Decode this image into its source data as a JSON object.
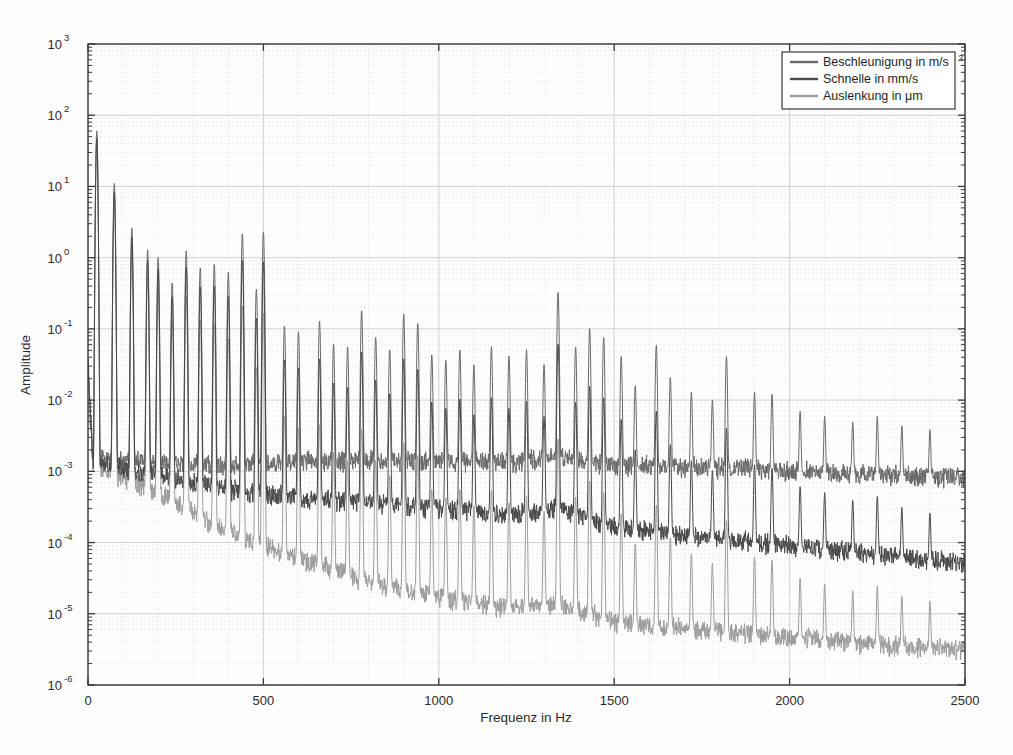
{
  "chart_data": {
    "type": "line",
    "title": "",
    "xlabel": "Frequenz in Hz",
    "ylabel": "Amplitude",
    "xlim": [
      0,
      2500
    ],
    "ylim": [
      1e-06,
      1000
    ],
    "yscale": "log",
    "xscale": "linear",
    "grid": true,
    "grid_minor": true,
    "legend_position": "top-right",
    "xticks": [
      0,
      500,
      1000,
      1500,
      2000,
      2500
    ],
    "xtick_labels": [
      "0",
      "500",
      "1000",
      "1500",
      "2000",
      "2500"
    ],
    "yticks": [
      1e-06,
      1e-05,
      0.0001,
      0.001,
      0.01,
      0.1,
      1,
      10,
      100,
      1000
    ],
    "ytick_labels": [
      "10-6",
      "10-5",
      "10-4",
      "10-3",
      "10-2",
      "10-1",
      "100",
      "101",
      "102",
      "103"
    ],
    "ytick_mantissa": [
      "10",
      "10",
      "10",
      "10",
      "10",
      "10",
      "10",
      "10",
      "10",
      "10"
    ],
    "ytick_exponents": [
      "-6",
      "-5",
      "-4",
      "-3",
      "-2",
      "-1",
      "0",
      "1",
      "2",
      "3"
    ],
    "series": [
      {
        "name": "Beschleunigung in m/s2",
        "label_base": "Beschleunigung in m/s",
        "label_exp": "2",
        "color": "#6b6b6b",
        "noise_floor": [
          {
            "f": 0,
            "a": 0.0016
          },
          {
            "f": 200,
            "a": 0.0013
          },
          {
            "f": 400,
            "a": 0.0012
          },
          {
            "f": 600,
            "a": 0.00135
          },
          {
            "f": 800,
            "a": 0.0014
          },
          {
            "f": 1000,
            "a": 0.0014
          },
          {
            "f": 1200,
            "a": 0.0013
          },
          {
            "f": 1340,
            "a": 0.0016
          },
          {
            "f": 1500,
            "a": 0.0012
          },
          {
            "f": 1800,
            "a": 0.0011
          },
          {
            "f": 2100,
            "a": 0.00095
          },
          {
            "f": 2500,
            "a": 0.0008
          }
        ],
        "peaks": [
          {
            "f": 25,
            "a": 60
          },
          {
            "f": 75,
            "a": 11
          },
          {
            "f": 125,
            "a": 2.6
          },
          {
            "f": 170,
            "a": 1.3
          },
          {
            "f": 200,
            "a": 1.0
          },
          {
            "f": 240,
            "a": 0.45
          },
          {
            "f": 280,
            "a": 1.25
          },
          {
            "f": 320,
            "a": 0.72
          },
          {
            "f": 360,
            "a": 0.82
          },
          {
            "f": 400,
            "a": 0.62
          },
          {
            "f": 440,
            "a": 2.2
          },
          {
            "f": 480,
            "a": 0.36
          },
          {
            "f": 500,
            "a": 2.3
          },
          {
            "f": 560,
            "a": 0.11
          },
          {
            "f": 600,
            "a": 0.09
          },
          {
            "f": 660,
            "a": 0.13
          },
          {
            "f": 700,
            "a": 0.06
          },
          {
            "f": 740,
            "a": 0.055
          },
          {
            "f": 780,
            "a": 0.18
          },
          {
            "f": 820,
            "a": 0.075
          },
          {
            "f": 860,
            "a": 0.05
          },
          {
            "f": 900,
            "a": 0.16
          },
          {
            "f": 940,
            "a": 0.12
          },
          {
            "f": 980,
            "a": 0.042
          },
          {
            "f": 1020,
            "a": 0.035
          },
          {
            "f": 1060,
            "a": 0.05
          },
          {
            "f": 1100,
            "a": 0.03
          },
          {
            "f": 1150,
            "a": 0.055
          },
          {
            "f": 1200,
            "a": 0.04
          },
          {
            "f": 1250,
            "a": 0.05
          },
          {
            "f": 1300,
            "a": 0.03
          },
          {
            "f": 1340,
            "a": 0.33
          },
          {
            "f": 1390,
            "a": 0.055
          },
          {
            "f": 1430,
            "a": 0.1
          },
          {
            "f": 1470,
            "a": 0.075
          },
          {
            "f": 1520,
            "a": 0.04
          },
          {
            "f": 1560,
            "a": 0.015
          },
          {
            "f": 1620,
            "a": 0.058
          },
          {
            "f": 1660,
            "a": 0.02
          },
          {
            "f": 1720,
            "a": 0.012
          },
          {
            "f": 1780,
            "a": 0.009
          },
          {
            "f": 1820,
            "a": 0.04
          },
          {
            "f": 1900,
            "a": 0.012
          },
          {
            "f": 1950,
            "a": 0.011
          },
          {
            "f": 2030,
            "a": 0.006
          },
          {
            "f": 2100,
            "a": 0.005
          },
          {
            "f": 2180,
            "a": 0.004
          },
          {
            "f": 2250,
            "a": 0.005
          },
          {
            "f": 2320,
            "a": 0.0035
          },
          {
            "f": 2400,
            "a": 0.003
          }
        ]
      },
      {
        "name": "Schnelle in mm/s",
        "label_base": "Schnelle in mm/s",
        "label_exp": "",
        "color": "#4a4a4a",
        "noise_floor": [
          {
            "f": 0,
            "a": 0.0013
          },
          {
            "f": 200,
            "a": 0.0009
          },
          {
            "f": 400,
            "a": 0.00055
          },
          {
            "f": 600,
            "a": 0.00042
          },
          {
            "f": 800,
            "a": 0.00036
          },
          {
            "f": 1000,
            "a": 0.0003
          },
          {
            "f": 1200,
            "a": 0.00024
          },
          {
            "f": 1340,
            "a": 0.0003
          },
          {
            "f": 1500,
            "a": 0.00016
          },
          {
            "f": 1800,
            "a": 0.00011
          },
          {
            "f": 2100,
            "a": 8e-05
          },
          {
            "f": 2500,
            "a": 5e-05
          }
        ],
        "peaks": [
          {
            "f": 25,
            "a": 60
          },
          {
            "f": 75,
            "a": 11
          },
          {
            "f": 125,
            "a": 2.6
          },
          {
            "f": 170,
            "a": 1.3
          },
          {
            "f": 200,
            "a": 1.0
          },
          {
            "f": 240,
            "a": 0.45
          },
          {
            "f": 280,
            "a": 1.25
          },
          {
            "f": 320,
            "a": 0.72
          },
          {
            "f": 360,
            "a": 0.82
          },
          {
            "f": 400,
            "a": 0.62
          },
          {
            "f": 440,
            "a": 2.2
          },
          {
            "f": 480,
            "a": 0.36
          },
          {
            "f": 500,
            "a": 2.3
          },
          {
            "f": 560,
            "a": 0.11
          },
          {
            "f": 600,
            "a": 0.09
          },
          {
            "f": 660,
            "a": 0.13
          },
          {
            "f": 700,
            "a": 0.06
          },
          {
            "f": 740,
            "a": 0.055
          },
          {
            "f": 780,
            "a": 0.18
          },
          {
            "f": 820,
            "a": 0.075
          },
          {
            "f": 860,
            "a": 0.05
          },
          {
            "f": 900,
            "a": 0.16
          },
          {
            "f": 940,
            "a": 0.12
          },
          {
            "f": 980,
            "a": 0.042
          },
          {
            "f": 1020,
            "a": 0.035
          },
          {
            "f": 1060,
            "a": 0.05
          },
          {
            "f": 1100,
            "a": 0.03
          },
          {
            "f": 1150,
            "a": 0.055
          },
          {
            "f": 1200,
            "a": 0.04
          },
          {
            "f": 1250,
            "a": 0.05
          },
          {
            "f": 1300,
            "a": 0.03
          },
          {
            "f": 1340,
            "a": 0.33
          },
          {
            "f": 1390,
            "a": 0.055
          },
          {
            "f": 1430,
            "a": 0.1
          },
          {
            "f": 1470,
            "a": 0.075
          },
          {
            "f": 1520,
            "a": 0.04
          },
          {
            "f": 1560,
            "a": 0.015
          },
          {
            "f": 1620,
            "a": 0.058
          },
          {
            "f": 1660,
            "a": 0.02
          },
          {
            "f": 1720,
            "a": 0.012
          },
          {
            "f": 1780,
            "a": 0.009
          },
          {
            "f": 1820,
            "a": 0.04
          },
          {
            "f": 1900,
            "a": 0.012
          },
          {
            "f": 1950,
            "a": 0.011
          },
          {
            "f": 2030,
            "a": 0.006
          },
          {
            "f": 2100,
            "a": 0.005
          },
          {
            "f": 2180,
            "a": 0.004
          },
          {
            "f": 2250,
            "a": 0.005
          },
          {
            "f": 2320,
            "a": 0.0035
          },
          {
            "f": 2400,
            "a": 0.003
          }
        ]
      },
      {
        "name": "Auslenkung in um",
        "label_base": "Auslenkung in ",
        "label_exp": "",
        "label_mu": "μm",
        "color": "#9d9d9d",
        "noise_floor": [
          {
            "f": 0,
            "a": 0.0013
          },
          {
            "f": 200,
            "a": 0.00048
          },
          {
            "f": 400,
            "a": 0.00014
          },
          {
            "f": 600,
            "a": 6e-05
          },
          {
            "f": 800,
            "a": 2.8e-05
          },
          {
            "f": 1000,
            "a": 1.7e-05
          },
          {
            "f": 1200,
            "a": 1.15e-05
          },
          {
            "f": 1340,
            "a": 1.4e-05
          },
          {
            "f": 1500,
            "a": 7.5e-06
          },
          {
            "f": 1800,
            "a": 5.5e-06
          },
          {
            "f": 2100,
            "a": 4.2e-06
          },
          {
            "f": 2500,
            "a": 3e-06
          }
        ],
        "peaks": [
          {
            "f": 25,
            "a": 60
          },
          {
            "f": 75,
            "a": 11
          },
          {
            "f": 125,
            "a": 2.6
          },
          {
            "f": 170,
            "a": 1.3
          },
          {
            "f": 200,
            "a": 1.0
          },
          {
            "f": 240,
            "a": 0.45
          },
          {
            "f": 280,
            "a": 1.25
          },
          {
            "f": 320,
            "a": 0.72
          },
          {
            "f": 360,
            "a": 0.82
          },
          {
            "f": 400,
            "a": 0.62
          },
          {
            "f": 440,
            "a": 2.2
          },
          {
            "f": 480,
            "a": 0.36
          },
          {
            "f": 500,
            "a": 2.3
          },
          {
            "f": 560,
            "a": 0.11
          },
          {
            "f": 600,
            "a": 0.09
          },
          {
            "f": 660,
            "a": 0.13
          },
          {
            "f": 700,
            "a": 0.06
          },
          {
            "f": 740,
            "a": 0.055
          },
          {
            "f": 780,
            "a": 0.18
          },
          {
            "f": 820,
            "a": 0.075
          },
          {
            "f": 860,
            "a": 0.05
          },
          {
            "f": 900,
            "a": 0.16
          },
          {
            "f": 940,
            "a": 0.12
          },
          {
            "f": 980,
            "a": 0.042
          },
          {
            "f": 1020,
            "a": 0.035
          },
          {
            "f": 1060,
            "a": 0.05
          },
          {
            "f": 1100,
            "a": 0.03
          },
          {
            "f": 1150,
            "a": 0.055
          },
          {
            "f": 1200,
            "a": 0.04
          },
          {
            "f": 1250,
            "a": 0.05
          },
          {
            "f": 1300,
            "a": 0.03
          },
          {
            "f": 1340,
            "a": 0.33
          },
          {
            "f": 1390,
            "a": 0.055
          },
          {
            "f": 1430,
            "a": 0.1
          },
          {
            "f": 1470,
            "a": 0.075
          },
          {
            "f": 1520,
            "a": 0.04
          },
          {
            "f": 1560,
            "a": 0.015
          },
          {
            "f": 1620,
            "a": 0.058
          },
          {
            "f": 1660,
            "a": 0.02
          },
          {
            "f": 1720,
            "a": 0.012
          },
          {
            "f": 1780,
            "a": 0.009
          },
          {
            "f": 1820,
            "a": 0.04
          },
          {
            "f": 1900,
            "a": 0.012
          },
          {
            "f": 1950,
            "a": 0.011
          },
          {
            "f": 2030,
            "a": 0.006
          },
          {
            "f": 2100,
            "a": 0.005
          },
          {
            "f": 2180,
            "a": 0.004
          },
          {
            "f": 2250,
            "a": 0.005
          },
          {
            "f": 2320,
            "a": 0.0035
          },
          {
            "f": 2400,
            "a": 0.003
          }
        ]
      }
    ]
  },
  "legend": {
    "items": [
      {
        "label": "Beschleunigung in m/s",
        "sup": "2",
        "color": "#6b6b6b"
      },
      {
        "label": "Schnelle in mm/s",
        "sup": "",
        "color": "#4a4a4a"
      },
      {
        "label": "Auslenkung in μm",
        "sup": "",
        "color": "#9d9d9d"
      }
    ]
  },
  "axes": {
    "x_title": "Frequenz in Hz",
    "y_title": "Amplitude"
  },
  "colors": {
    "frame": "#3a3a3a",
    "grid_major": "#c9c9c9",
    "grid_minor": "#dcdcdc",
    "background": "#fdfdfd",
    "text": "#2b2b2b"
  }
}
